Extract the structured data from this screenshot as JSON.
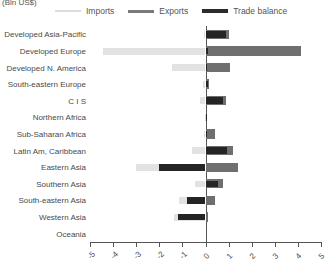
{
  "axis_unit_label": "(Bln US$)",
  "legend": {
    "items": [
      {
        "label": "Imports",
        "color": "#e2e2e2",
        "key": "imports"
      },
      {
        "label": "Exports",
        "color": "#6f6f6f",
        "key": "exports"
      },
      {
        "label": "Trade balance",
        "color": "#242424",
        "key": "balance"
      }
    ]
  },
  "chart_data": {
    "type": "bar",
    "orientation": "horizontal",
    "title": "(Bln US$)",
    "xlabel": "",
    "ylabel": "",
    "xlim": [
      -5,
      5
    ],
    "xticks": [
      -5,
      -4,
      -3,
      -2,
      -1,
      0,
      1,
      2,
      3,
      4,
      5
    ],
    "xtick_labels": [
      "-5",
      "-4",
      "-3",
      "-2",
      "-1",
      "0",
      "1",
      "2",
      "3",
      "4",
      "5"
    ],
    "grid": false,
    "legend_position": "top",
    "zero_line": 0,
    "categories": [
      "Developed Asia-Pacific",
      "Developed Europe",
      "Developed N. America",
      "South-eastern Europe",
      "C I S",
      "Northern Africa",
      "Sub-Saharan Africa",
      "Latin Am, Caribbean",
      "Eastern Asia",
      "Southern Asia",
      "South-eastern Asia",
      "Western Asia",
      "Oceania"
    ],
    "series": [
      {
        "name": "Imports",
        "color": "#e2e2e2",
        "values": [
          -0.05,
          -4.45,
          -1.45,
          -0.1,
          -0.25,
          -0.03,
          -0.05,
          -0.6,
          -3.0,
          -0.45,
          -1.15,
          -1.35,
          0
        ]
      },
      {
        "name": "Exports",
        "color": "#6f6f6f",
        "values": [
          1.0,
          4.15,
          1.05,
          0.15,
          0.9,
          0.05,
          0.4,
          1.2,
          1.4,
          0.75,
          0.4,
          0.1,
          0
        ]
      },
      {
        "name": "Trade balance",
        "color": "#242424",
        "values": [
          0.9,
          0.1,
          0.08,
          0.1,
          0.75,
          0.03,
          0.05,
          0.95,
          -2.0,
          0.55,
          -0.8,
          -1.2,
          0
        ]
      }
    ]
  }
}
